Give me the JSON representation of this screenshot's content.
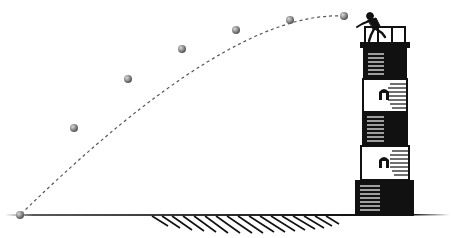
{
  "diagram": {
    "type": "projectile-motion-illustration",
    "colors": {
      "background": "#ffffff",
      "ink": "#111111",
      "ball": "#8a8a8a",
      "trajectory": "#555555"
    },
    "trajectory": {
      "style": "dashed",
      "ball_positions": [
        {
          "x": 344,
          "y": 16
        },
        {
          "x": 290,
          "y": 20
        },
        {
          "x": 236,
          "y": 30
        },
        {
          "x": 182,
          "y": 49
        },
        {
          "x": 128,
          "y": 79
        },
        {
          "x": 74,
          "y": 128
        },
        {
          "x": 20,
          "y": 215
        }
      ]
    },
    "lighthouse": {
      "bands": [
        "dark",
        "light",
        "dark",
        "light",
        "dark"
      ],
      "windows": 2,
      "has_railing": true
    },
    "ground": {
      "y": 215,
      "hatched": true
    },
    "person": {
      "pose": "throwing",
      "location": "lighthouse top"
    }
  }
}
